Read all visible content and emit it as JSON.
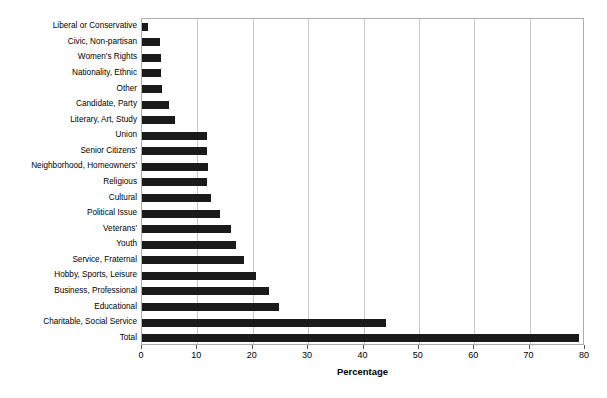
{
  "chart_data": {
    "type": "bar",
    "orientation": "horizontal",
    "title": "",
    "xlabel": "Percentage",
    "ylabel": "",
    "xlim": [
      0,
      80
    ],
    "xticks": [
      0,
      10,
      20,
      30,
      40,
      50,
      60,
      70,
      80
    ],
    "xtick_labels": [
      "0",
      "10",
      "20",
      "30",
      "40",
      "50",
      "60",
      "70",
      "80"
    ],
    "grid": "vertical",
    "legend": "none",
    "bar_color": "#1a1a1a",
    "categories": [
      "Liberal or Conservative",
      "Civic, Non-partisan",
      "Women's Rights",
      "Nationality, Ethnic",
      "Other",
      "Candidate, Party",
      "Literary, Art, Study",
      "Union",
      "Senior Citizens'",
      "Neighborhood, Homeowners'",
      "Religious",
      "Cultural",
      "Political Issue",
      "Veterans'",
      "Youth",
      "Service, Fraternal",
      "Hobby, Sports, Leisure",
      "Business, Professional",
      "Educational",
      "Charitable, Social Service",
      "Total"
    ],
    "values": [
      1.0,
      3.2,
      3.5,
      3.5,
      3.6,
      4.8,
      6.0,
      11.8,
      11.8,
      11.9,
      11.7,
      12.5,
      14.0,
      16.0,
      17.0,
      18.5,
      20.5,
      23.0,
      24.8,
      44.0,
      79.0
    ]
  }
}
